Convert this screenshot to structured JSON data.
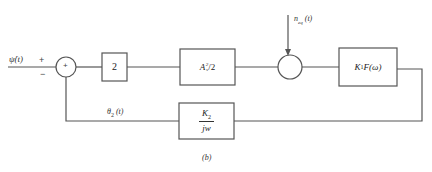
{
  "diagram": {
    "type": "block-diagram",
    "caption": "(b)",
    "input": {
      "label": "ψ̇(t)",
      "plus_sign": "+",
      "minus_sign": "−"
    },
    "summing_junction": {
      "symbol": "+"
    },
    "blocks": [
      {
        "id": "gain",
        "label": "2"
      },
      {
        "id": "amplitude",
        "label_base": "A",
        "label_sub": "s",
        "label_sup": "2",
        "label_tail": "/2"
      },
      {
        "id": "filter",
        "label_base": "K",
        "label_sub": "1",
        "label_tail": " F(ω)"
      },
      {
        "id": "integrator",
        "numerator_base": "K",
        "numerator_sub": "2",
        "denominator": "jw"
      }
    ],
    "noise": {
      "label_base": "n",
      "label_sub": "eq",
      "label_tail": " (t)"
    },
    "feedback": {
      "label_base": "θ",
      "label_sub": "2",
      "label_tail": " (t)"
    },
    "line_color": "#555555"
  }
}
